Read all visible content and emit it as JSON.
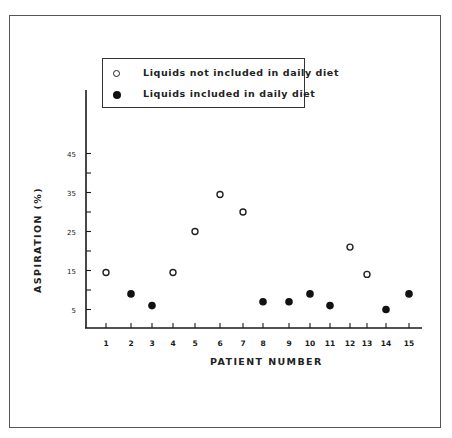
{
  "chart_data": {
    "type": "scatter",
    "title": "",
    "xlabel": "PATIENT NUMBER",
    "ylabel": "ASPIRATION (%)",
    "x_ticks": [
      "1",
      "2",
      "3",
      "4",
      "5",
      "6",
      "7",
      "8",
      "9",
      "10",
      "11",
      "12",
      "13",
      "14",
      "15"
    ],
    "y_ticks": [
      "5",
      "15",
      "25",
      "35",
      "45"
    ],
    "ylim": [
      0,
      50
    ],
    "grid": false,
    "legend_position": "upper-left inside",
    "series": [
      {
        "name": "Liquids not included in daily diet",
        "marker": "open-circle",
        "points": [
          {
            "x": 1,
            "y": 14.5
          },
          {
            "x": 4,
            "y": 14.5
          },
          {
            "x": 5,
            "y": 25
          },
          {
            "x": 6,
            "y": 34.5
          },
          {
            "x": 7,
            "y": 30
          },
          {
            "x": 12,
            "y": 21
          },
          {
            "x": 13,
            "y": 14
          }
        ]
      },
      {
        "name": "Liquids included in daily diet",
        "marker": "filled-circle",
        "points": [
          {
            "x": 2,
            "y": 9
          },
          {
            "x": 3,
            "y": 6
          },
          {
            "x": 8,
            "y": 7
          },
          {
            "x": 9,
            "y": 7
          },
          {
            "x": 10,
            "y": 9
          },
          {
            "x": 11,
            "y": 6
          },
          {
            "x": 14,
            "y": 5
          },
          {
            "x": 15,
            "y": 9
          }
        ]
      }
    ]
  },
  "legend": {
    "items": [
      {
        "label": "Liquids not included in daily diet",
        "marker": "open-circle"
      },
      {
        "label": "Liquids included in daily diet",
        "marker": "filled-circle"
      }
    ]
  },
  "axes": {
    "x_title": "PATIENT NUMBER",
    "y_title": "ASPIRATION (%)"
  },
  "colors": {
    "ink": "#1a1a1a",
    "frame": "#555555",
    "background": "#ffffff"
  }
}
